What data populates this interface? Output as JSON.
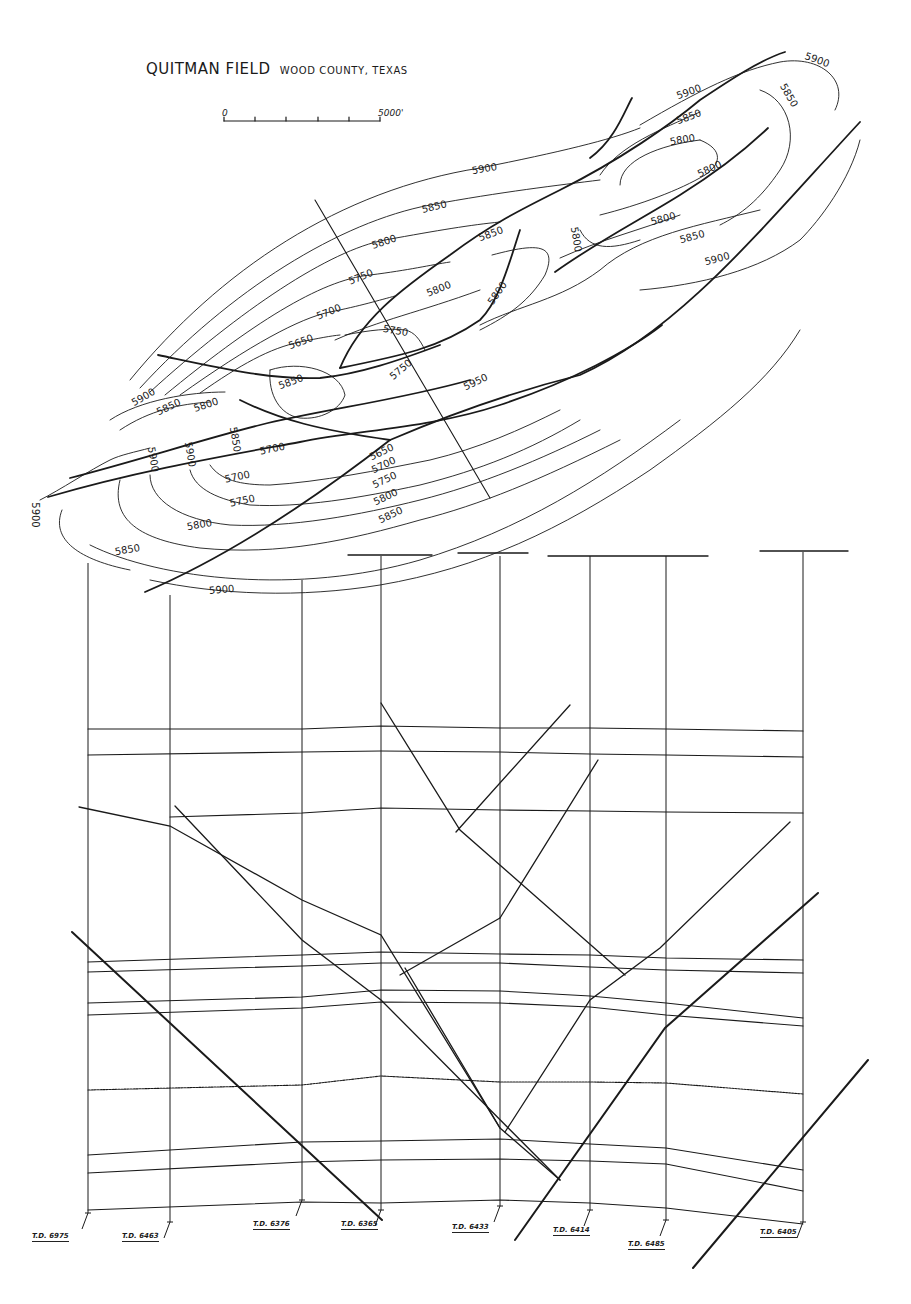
{
  "title": {
    "field": "QUITMAN FIELD",
    "location": "WOOD COUNTY, TEXAS"
  },
  "scale_bar": {
    "start_label": "0",
    "end_label": "5000'"
  },
  "contour_labels": [
    {
      "text": "5900",
      "x": 485,
      "y": 172,
      "r": -10
    },
    {
      "text": "5850",
      "x": 435,
      "y": 210,
      "r": -14
    },
    {
      "text": "5800",
      "x": 385,
      "y": 245,
      "r": -18
    },
    {
      "text": "5750",
      "x": 362,
      "y": 280,
      "r": -22
    },
    {
      "text": "5700",
      "x": 330,
      "y": 315,
      "r": -22
    },
    {
      "text": "5650",
      "x": 302,
      "y": 345,
      "r": -20
    },
    {
      "text": "5800",
      "x": 440,
      "y": 292,
      "r": -22
    },
    {
      "text": "5750",
      "x": 395,
      "y": 334,
      "r": 10
    },
    {
      "text": "5850",
      "x": 492,
      "y": 237,
      "r": -20
    },
    {
      "text": "5800",
      "x": 500,
      "y": 295,
      "r": -55
    },
    {
      "text": "5750",
      "x": 403,
      "y": 372,
      "r": -40
    },
    {
      "text": "5950",
      "x": 477,
      "y": 385,
      "r": -25
    },
    {
      "text": "5850",
      "x": 292,
      "y": 385,
      "r": -20
    },
    {
      "text": "5900",
      "x": 145,
      "y": 400,
      "r": -30
    },
    {
      "text": "5850",
      "x": 170,
      "y": 410,
      "r": -25
    },
    {
      "text": "5800",
      "x": 207,
      "y": 408,
      "r": -18
    },
    {
      "text": "5900",
      "x": 150,
      "y": 460,
      "r": 80
    },
    {
      "text": "5900",
      "x": 187,
      "y": 455,
      "r": 80
    },
    {
      "text": "5850",
      "x": 232,
      "y": 440,
      "r": 80
    },
    {
      "text": "5700",
      "x": 273,
      "y": 452,
      "r": -12
    },
    {
      "text": "5700",
      "x": 238,
      "y": 480,
      "r": -12
    },
    {
      "text": "5750",
      "x": 243,
      "y": 504,
      "r": -12
    },
    {
      "text": "5800",
      "x": 200,
      "y": 528,
      "r": -10
    },
    {
      "text": "5850",
      "x": 128,
      "y": 553,
      "r": -10
    },
    {
      "text": "5900",
      "x": 222,
      "y": 593,
      "r": -5
    },
    {
      "text": "5900",
      "x": 32,
      "y": 515,
      "r": 90
    },
    {
      "text": "5650",
      "x": 383,
      "y": 455,
      "r": -25
    },
    {
      "text": "5700",
      "x": 385,
      "y": 468,
      "r": -25
    },
    {
      "text": "5750",
      "x": 386,
      "y": 483,
      "r": -25
    },
    {
      "text": "5800",
      "x": 387,
      "y": 500,
      "r": -25
    },
    {
      "text": "5850",
      "x": 392,
      "y": 518,
      "r": -25
    },
    {
      "text": "5900",
      "x": 690,
      "y": 95,
      "r": -20
    },
    {
      "text": "5850",
      "x": 690,
      "y": 120,
      "r": -20
    },
    {
      "text": "5800",
      "x": 683,
      "y": 143,
      "r": -10
    },
    {
      "text": "5900",
      "x": 816,
      "y": 63,
      "r": 20
    },
    {
      "text": "5850",
      "x": 786,
      "y": 97,
      "r": 60
    },
    {
      "text": "5800",
      "x": 711,
      "y": 172,
      "r": -25
    },
    {
      "text": "5800",
      "x": 664,
      "y": 222,
      "r": -15
    },
    {
      "text": "5850",
      "x": 693,
      "y": 240,
      "r": -15
    },
    {
      "text": "5900",
      "x": 718,
      "y": 262,
      "r": -15
    },
    {
      "text": "5800",
      "x": 573,
      "y": 240,
      "r": 80
    }
  ],
  "cross_section": {
    "wells": [
      {
        "x": 88,
        "top": 563,
        "bottom": 1213,
        "td": "T.D. 6975",
        "lx": 32,
        "ly": 1232
      },
      {
        "x": 170,
        "top": 595,
        "bottom": 1222,
        "td": "T.D. 6463",
        "lx": 122,
        "ly": 1232
      },
      {
        "x": 302,
        "top": 580,
        "bottom": 1200,
        "td": "T.D. 6376",
        "lx": 253,
        "ly": 1220
      },
      {
        "x": 381,
        "top": 556,
        "bottom": 1210,
        "td": "T.D. 6365",
        "lx": 341,
        "ly": 1220
      },
      {
        "x": 500,
        "top": 556,
        "bottom": 1206,
        "td": "T.D. 6433",
        "lx": 452,
        "ly": 1223
      },
      {
        "x": 590,
        "top": 556,
        "bottom": 1210,
        "td": "T.D. 6414",
        "lx": 553,
        "ly": 1226
      },
      {
        "x": 666,
        "top": 556,
        "bottom": 1220,
        "td": "T.D. 6485",
        "lx": 628,
        "ly": 1240
      },
      {
        "x": 803,
        "top": 552,
        "bottom": 1222,
        "td": "T.D. 6405",
        "lx": 760,
        "ly": 1228
      }
    ]
  }
}
